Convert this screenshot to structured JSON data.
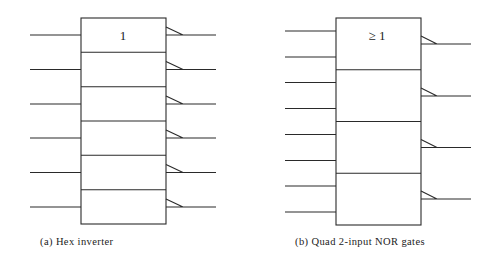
{
  "diagram_a": {
    "symbol": "1",
    "caption": "(a) Hex inverter",
    "gate_count": 6,
    "inputs_per_gate": 1
  },
  "diagram_b": {
    "symbol": "≥ 1",
    "caption": "(b) Quad 2-input NOR gates",
    "gate_count": 4,
    "inputs_per_gate": 2
  },
  "colors": {
    "line": "#2a2a2a",
    "background": "#ffffff"
  }
}
